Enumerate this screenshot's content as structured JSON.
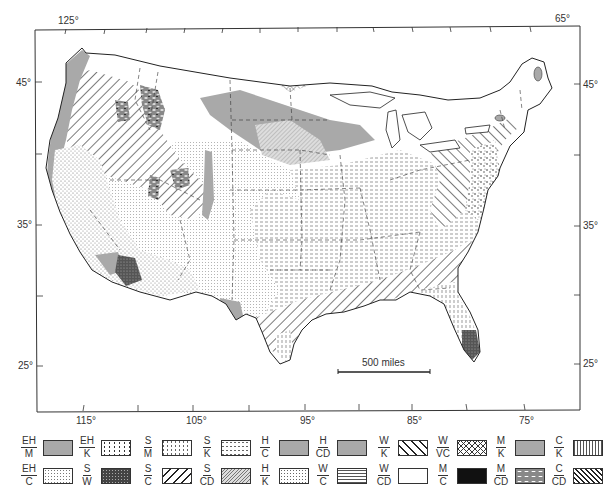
{
  "map": {
    "title": "Soil regions of the conterminous United States",
    "longitude_labels_top": [
      "125°",
      "65°"
    ],
    "longitude_labels_bottom": [
      "115°",
      "105°",
      "95°",
      "85°",
      "75°"
    ],
    "latitude_labels_left": [
      "45°",
      "35°",
      "25°"
    ],
    "latitude_labels_right": [
      "45°",
      "35°",
      "25°"
    ],
    "scale_bar_label": "500 miles"
  },
  "legend": {
    "items": [
      {
        "num": "EH",
        "den": "M",
        "pattern": "gray-solid"
      },
      {
        "num": "EH",
        "den": "C",
        "pattern": "fine-stipple"
      },
      {
        "num": "EH",
        "den": "K",
        "pattern": "coarse-stipple"
      },
      {
        "num": "S",
        "den": "W",
        "pattern": "dark-stipple"
      },
      {
        "num": "S",
        "den": "M",
        "pattern": "vertical-dashes"
      },
      {
        "num": "S",
        "den": "C",
        "pattern": "wide-forward-hatch"
      },
      {
        "num": "S",
        "den": "K",
        "pattern": "horizontal-dashes"
      },
      {
        "num": "S",
        "den": "CD",
        "pattern": "fine-forward-hatch"
      },
      {
        "num": "H",
        "den": "C",
        "pattern": "gray-solid"
      },
      {
        "num": "H",
        "den": "K",
        "pattern": "dot-grid"
      },
      {
        "num": "H",
        "den": "CD",
        "pattern": "gray-solid"
      },
      {
        "num": "W",
        "den": "C",
        "pattern": "horizontal-lines"
      },
      {
        "num": "W",
        "den": "K",
        "pattern": "back-hatch"
      },
      {
        "num": "W",
        "den": "CD",
        "pattern": "white"
      },
      {
        "num": "W",
        "den": "VC",
        "pattern": "crosshatch"
      },
      {
        "num": "M",
        "den": "C",
        "pattern": "black-solid"
      },
      {
        "num": "M",
        "den": "K",
        "pattern": "gray-solid"
      },
      {
        "num": "M",
        "den": "CD",
        "pattern": "mottled"
      },
      {
        "num": "C",
        "den": "K",
        "pattern": "vertical-lines"
      },
      {
        "num": "C",
        "den": "CD",
        "pattern": "dense-back-hatch"
      }
    ]
  },
  "colors": {
    "ink": "#333333",
    "gray_fill": "#a9a9a9",
    "dark_fill": "#111111",
    "background": "#ffffff"
  }
}
